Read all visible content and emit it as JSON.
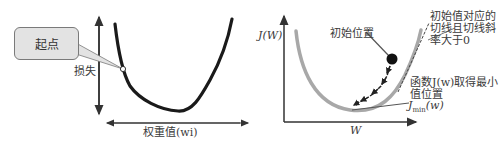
{
  "left_panel": {
    "callout_text": "起点",
    "y_axis_label": "损失",
    "x_axis_label": "权重值(wi)"
  },
  "right_panel": {
    "y_axis_label": "J(W)",
    "x_axis_label": "W",
    "initial_position_label": "初始位置",
    "tangent_note_line1": "初始值对应的",
    "tangent_note_line2": "切线且切线斜",
    "tangent_note_line3": "率大于0",
    "minimum_note_line1": "函数J(w)取得最小",
    "minimum_note_line2": "值位置",
    "minimum_label": "J_min(w)",
    "minimum_label_main": "J",
    "minimum_label_sub": "min",
    "minimum_label_arg": "(w)"
  },
  "colors": {
    "curve_dark": "#1a1a1a",
    "curve_gray": "#a8a8a8",
    "axis": "#333333",
    "callout_fill": "#e3e3e3"
  }
}
